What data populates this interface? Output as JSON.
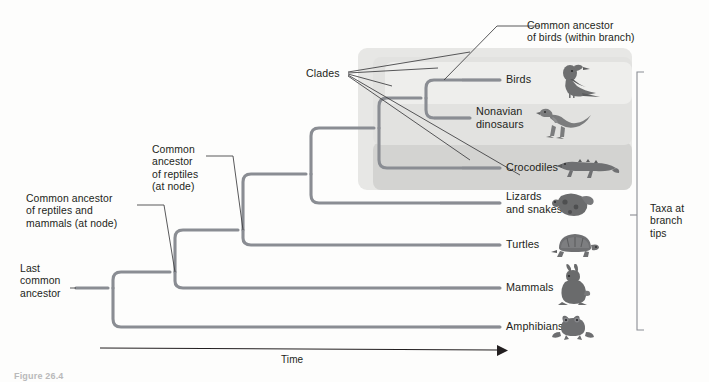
{
  "figure": {
    "type": "phylogenetic-tree",
    "caption_partial": "Figure 26.4",
    "branch_color": "#8a8d93",
    "leader_color": "#3b3b3d",
    "text_color": "#231f20",
    "clade_shade_outer": "#e6e6e4",
    "clade_shade_mid": "#d2d2d0",
    "clade_shade_inner": "#ebebe9"
  },
  "annotations": [
    {
      "id": "common-ancestor-birds",
      "text": "Common ancestor\nof birds (within branch)"
    },
    {
      "id": "clades",
      "text": "Clades"
    },
    {
      "id": "common-ancestor-reptiles",
      "text": "Common\nancestor\nof reptiles\n(at node)"
    },
    {
      "id": "common-ancestor-reptiles-mammals",
      "text": "Common ancestor\nof reptiles and\nmammals (at node)"
    },
    {
      "id": "last-common-ancestor",
      "text": "Last\ncommon\nancestor"
    },
    {
      "id": "taxa-at-branch-tips",
      "text": "Taxa at\nbranch\ntips"
    }
  ],
  "axis": {
    "label": "Time",
    "direction": "left-to-right"
  },
  "taxa": [
    {
      "id": "birds",
      "label": "Birds",
      "icon": "bird-icon",
      "y": 80
    },
    {
      "id": "nonavian-dinosaurs",
      "label": "Nonavian\ndinosaurs",
      "icon": "dinosaur-icon",
      "y": 118
    },
    {
      "id": "crocodiles",
      "label": "Crocodiles",
      "icon": "crocodile-icon",
      "y": 168
    },
    {
      "id": "lizards-snakes",
      "label": "Lizards\nand snakes",
      "icon": "snake-icon",
      "y": 203
    },
    {
      "id": "turtles",
      "label": "Turtles",
      "icon": "turtle-icon",
      "y": 245
    },
    {
      "id": "mammals",
      "label": "Mammals",
      "icon": "rabbit-icon",
      "y": 288
    },
    {
      "id": "amphibians",
      "label": "Amphibians",
      "icon": "frog-icon",
      "y": 327
    }
  ],
  "clades": [
    {
      "id": "clade-archosaurs-plus",
      "label": "outer clade (reptiles incl. birds)"
    },
    {
      "id": "clade-archosaurs",
      "label": "middle clade (birds, dinosaurs, crocodiles)"
    },
    {
      "id": "clade-birds",
      "label": "inner clade (birds)"
    }
  ]
}
